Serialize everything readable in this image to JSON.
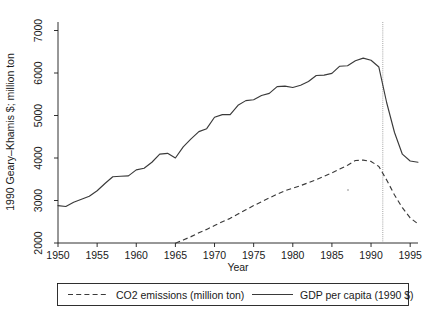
{
  "chart_data": {
    "type": "line",
    "title": "",
    "xlabel": "Year",
    "ylabel": "1990 Geary–Khamis $; million ton",
    "xlim": [
      1950,
      1996
    ],
    "ylim": [
      2000,
      7200
    ],
    "xticks": [
      1950,
      1955,
      1960,
      1965,
      1970,
      1975,
      1980,
      1985,
      1990,
      1995
    ],
    "yticks": [
      2000,
      3000,
      4000,
      5000,
      6000,
      7000
    ],
    "xtick_labels": [
      "1950",
      "1955",
      "1960",
      "1965",
      "1970",
      "1975",
      "1980",
      "1985",
      "1990",
      "1995"
    ],
    "ytick_labels": [
      "2000",
      "3000",
      "4000",
      "5000",
      "6000",
      "7000"
    ],
    "grid": false,
    "legend_position": "below",
    "annotations": [
      {
        "name": "dissolution-marker",
        "type": "vline",
        "x": 1991.5,
        "style": "dotted"
      }
    ],
    "series": [
      {
        "name": "GDP per capita (1990 $)",
        "style": "solid",
        "x": [
          1950,
          1951,
          1952,
          1953,
          1954,
          1955,
          1956,
          1957,
          1958,
          1959,
          1960,
          1961,
          1962,
          1963,
          1964,
          1965,
          1966,
          1967,
          1968,
          1969,
          1970,
          1971,
          1972,
          1973,
          1974,
          1975,
          1976,
          1977,
          1978,
          1979,
          1980,
          1981,
          1982,
          1983,
          1984,
          1985,
          1986,
          1987,
          1988,
          1989,
          1990,
          1991,
          1992,
          1993,
          1994,
          1995,
          1996
        ],
        "values": [
          2880,
          2860,
          2960,
          3030,
          3100,
          3230,
          3400,
          3560,
          3570,
          3580,
          3720,
          3760,
          3900,
          4090,
          4110,
          4000,
          4260,
          4450,
          4620,
          4690,
          4960,
          5020,
          5020,
          5240,
          5350,
          5370,
          5470,
          5520,
          5680,
          5690,
          5660,
          5710,
          5800,
          5940,
          5950,
          5990,
          6160,
          6170,
          6290,
          6350,
          6300,
          6140,
          5300,
          4600,
          4090,
          3930,
          3900
        ]
      },
      {
        "name": "CO2 emissions (million ton)",
        "style": "dashed",
        "x": [
          1965,
          1966,
          1967,
          1968,
          1969,
          1970,
          1971,
          1972,
          1973,
          1974,
          1975,
          1976,
          1977,
          1978,
          1979,
          1980,
          1981,
          1982,
          1983,
          1984,
          1985,
          1986,
          1987,
          1988,
          1989,
          1990,
          1991,
          1992,
          1993,
          1994,
          1995,
          1996
        ],
        "values": [
          1995,
          2070,
          2150,
          2240,
          2320,
          2410,
          2500,
          2580,
          2680,
          2780,
          2880,
          2970,
          3060,
          3150,
          3230,
          3290,
          3350,
          3420,
          3490,
          3570,
          3650,
          3740,
          3830,
          3940,
          3950,
          3920,
          3800,
          3480,
          3130,
          2830,
          2590,
          2450
        ]
      }
    ]
  },
  "legend": {
    "entries": [
      {
        "label": "CO2 emissions (million ton)",
        "style": "dashed"
      },
      {
        "label": "GDP per capita (1990 $)",
        "style": "solid"
      }
    ]
  }
}
